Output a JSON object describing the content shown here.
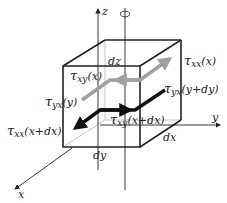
{
  "diagram": {
    "axes": {
      "z": {
        "label": "z"
      },
      "y": {
        "label": "y"
      },
      "x": {
        "label": "x"
      },
      "rotation_symbol": "rotation-about-vertical-axis"
    },
    "dimensions": {
      "dz": "dz",
      "dx": "dx",
      "dy": "dy"
    },
    "stress_labels": [
      {
        "id": "txx_x",
        "symbol": "τ",
        "subscript": "xx",
        "argument": "(x)"
      },
      {
        "id": "txy_x",
        "symbol": "τ",
        "subscript": "xy",
        "argument": "(x)"
      },
      {
        "id": "tyx_y",
        "symbol": "τ",
        "subscript": "yx",
        "argument": "(y)"
      },
      {
        "id": "tyx_ydy",
        "symbol": "τ",
        "subscript": "yx",
        "argument": "(y+dy)"
      },
      {
        "id": "txx_xdx",
        "symbol": "τ",
        "subscript": "xx",
        "argument": "(x+dx)"
      },
      {
        "id": "txy_xdx",
        "symbol": "τ",
        "subscript": "xy",
        "argument": "(x+dx)"
      }
    ],
    "colors": {
      "edge": "#222222",
      "hidden_edge": "#aaaaaa",
      "gray_arrow": "#a0a0a0",
      "black_arrow": "#111111"
    }
  }
}
